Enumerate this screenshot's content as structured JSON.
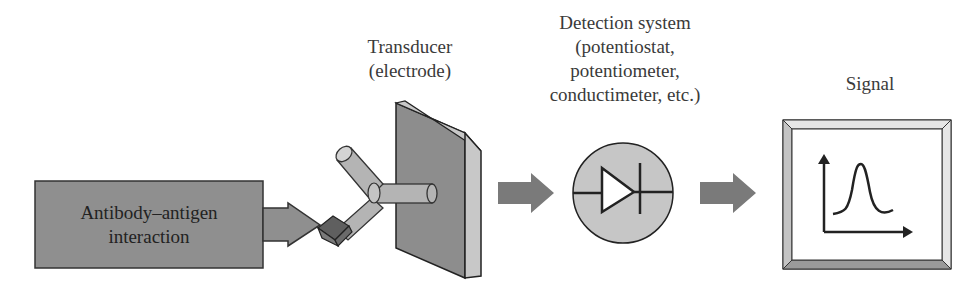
{
  "diagram": {
    "nodes": [
      {
        "id": "antibody-antigen",
        "label": "Antibody–antigen interaction",
        "lines": [
          "Antibody–antigen",
          "interaction"
        ]
      },
      {
        "id": "transducer",
        "label": "Transducer (electrode)",
        "lines": [
          "Transducer",
          "(electrode)"
        ]
      },
      {
        "id": "detection",
        "label": "Detection system (potentiostat, potentiometer, conductimeter, etc.)",
        "lines": [
          "Detection system",
          "(potentiostat,",
          "potentiometer,",
          "conductimeter, etc.)"
        ]
      },
      {
        "id": "signal",
        "label": "Signal",
        "lines": [
          "Signal"
        ]
      }
    ],
    "edges": [
      {
        "from": "antibody-antigen",
        "to": "transducer"
      },
      {
        "from": "transducer",
        "to": "detection"
      },
      {
        "from": "detection",
        "to": "signal"
      }
    ],
    "icons": {
      "antibody": "y-shaped-antibody-icon",
      "antigen": "cube-antigen-icon",
      "electrode": "plate-electrode-icon",
      "detector": "diode-circle-icon",
      "signal": "peak-graph-icon"
    },
    "colors": {
      "box_fill": "#8e8e8e",
      "arrow_fill": "#7a7a7a",
      "light_gray": "#c4c4c4",
      "outline": "#2a2a2a"
    }
  }
}
